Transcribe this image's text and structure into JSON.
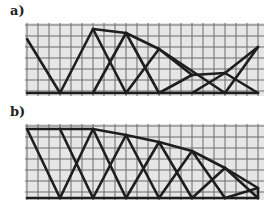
{
  "panels": [
    {
      "label": "a)",
      "label_pos": [
        10,
        14
      ],
      "grid": {
        "x0": 25,
        "x1": 264,
        "y0": 23,
        "y1": 96,
        "step": 11,
        "bg": "#e6e6e6",
        "line": "#6a6a6a"
      },
      "members": [
        [
          27,
          39,
          60,
          93
        ],
        [
          60,
          93,
          93,
          29
        ],
        [
          93,
          29,
          126,
          33
        ],
        [
          126,
          33,
          159,
          49
        ],
        [
          159,
          49,
          225,
          93
        ],
        [
          159,
          93,
          192,
          75
        ],
        [
          192,
          75,
          225,
          73
        ],
        [
          225,
          73,
          258,
          47
        ],
        [
          225,
          93,
          258,
          47
        ],
        [
          93,
          29,
          126,
          93
        ],
        [
          93,
          93,
          126,
          33
        ],
        [
          126,
          33,
          159,
          93
        ],
        [
          126,
          93,
          159,
          49
        ],
        [
          192,
          93,
          225,
          73
        ],
        [
          225,
          73,
          258,
          93
        ],
        [
          159,
          49,
          192,
          75
        ],
        [
          27,
          93,
          258,
          93
        ]
      ]
    },
    {
      "label": "b)",
      "label_pos": [
        10,
        116
      ],
      "grid": {
        "x0": 25,
        "x1": 264,
        "y0": 124,
        "y1": 200,
        "step": 11,
        "bg": "#e6e6e6",
        "line": "#6a6a6a"
      },
      "members": [
        [
          27,
          129,
          60,
          129
        ],
        [
          60,
          129,
          93,
          129
        ],
        [
          93,
          129,
          126,
          135
        ],
        [
          126,
          135,
          159,
          142
        ],
        [
          159,
          142,
          192,
          151
        ],
        [
          192,
          151,
          225,
          168
        ],
        [
          225,
          168,
          258,
          188
        ],
        [
          258,
          188,
          258,
          198
        ],
        [
          27,
          198,
          258,
          198
        ],
        [
          27,
          129,
          60,
          198
        ],
        [
          60,
          198,
          93,
          129
        ],
        [
          60,
          129,
          93,
          198
        ],
        [
          93,
          198,
          126,
          135
        ],
        [
          93,
          129,
          126,
          198
        ],
        [
          126,
          198,
          159,
          142
        ],
        [
          126,
          135,
          159,
          198
        ],
        [
          159,
          198,
          192,
          151
        ],
        [
          159,
          142,
          192,
          198
        ],
        [
          192,
          198,
          225,
          168
        ],
        [
          192,
          151,
          225,
          198
        ],
        [
          225,
          198,
          258,
          188
        ],
        [
          225,
          168,
          258,
          198
        ]
      ]
    }
  ],
  "colors": {
    "member": "#1e1e1e"
  }
}
